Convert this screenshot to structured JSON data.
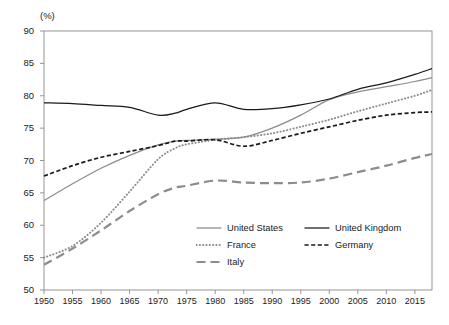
{
  "axis_unit_label": "(%)",
  "colors": {
    "gray_series": "#8c8c8c",
    "dark_series": "#1a1a1a",
    "axis": "#8a8a8a",
    "text": "#1a1a1a",
    "background": "#ffffff"
  },
  "legend": {
    "entries": [
      {
        "label": "United States",
        "style": "solid",
        "color": "#8c8c8c",
        "row": 0,
        "col": 0
      },
      {
        "label": "United Kingdom",
        "style": "solid",
        "color": "#1a1a1a",
        "row": 0,
        "col": 1
      },
      {
        "label": "France",
        "style": "dotted",
        "color": "#8c8c8c",
        "row": 1,
        "col": 0
      },
      {
        "label": "Germany",
        "style": "dashed",
        "color": "#1a1a1a",
        "row": 1,
        "col": 1
      },
      {
        "label": "Italy",
        "style": "longdash",
        "color": "#8c8c8c",
        "row": 2,
        "col": 0
      }
    ]
  },
  "chart_data": {
    "type": "line",
    "title": "",
    "subtitle": "",
    "xlabel": "",
    "ylabel": "",
    "unit": "(%)",
    "xlim": [
      1950,
      2018
    ],
    "ylim": [
      50,
      90
    ],
    "yticks": [
      50,
      55,
      60,
      65,
      70,
      75,
      80,
      85,
      90
    ],
    "xticks": [
      1950,
      1955,
      1960,
      1965,
      1970,
      1975,
      1980,
      1985,
      1990,
      1995,
      2000,
      2005,
      2010,
      2015
    ],
    "grid": false,
    "legend_position": "bottom-center",
    "series": [
      {
        "name": "United States",
        "style": "solid",
        "color": "#8c8c8c",
        "x": [
          1950,
          1955,
          1960,
          1965,
          1970,
          1973,
          1975,
          1980,
          1985,
          1990,
          1995,
          2000,
          2005,
          2010,
          2015,
          2018
        ],
        "values": [
          63.8,
          66.4,
          68.8,
          70.8,
          72.4,
          73.0,
          73.1,
          73.3,
          73.6,
          75.0,
          77.0,
          79.4,
          80.6,
          81.4,
          82.2,
          82.8
        ]
      },
      {
        "name": "United Kingdom",
        "style": "solid",
        "color": "#1a1a1a",
        "x": [
          1950,
          1955,
          1960,
          1965,
          1970,
          1973,
          1975,
          1980,
          1985,
          1990,
          1995,
          2000,
          2005,
          2010,
          2015,
          2018
        ],
        "values": [
          78.9,
          78.8,
          78.5,
          78.2,
          77.0,
          77.3,
          77.9,
          78.9,
          77.9,
          78.0,
          78.6,
          79.5,
          81.0,
          82.0,
          83.3,
          84.2
        ]
      },
      {
        "name": "France",
        "style": "dotted",
        "color": "#8c8c8c",
        "x": [
          1950,
          1955,
          1960,
          1965,
          1970,
          1973,
          1975,
          1980,
          1985,
          1990,
          1995,
          2000,
          2005,
          2010,
          2015,
          2018
        ],
        "values": [
          55.0,
          56.8,
          60.4,
          65.2,
          70.2,
          71.9,
          72.5,
          73.2,
          73.6,
          74.2,
          75.2,
          76.3,
          77.6,
          78.8,
          80.0,
          80.9
        ]
      },
      {
        "name": "Germany",
        "style": "dashed",
        "color": "#1a1a1a",
        "x": [
          1950,
          1955,
          1960,
          1965,
          1970,
          1973,
          1975,
          1980,
          1985,
          1990,
          1995,
          2000,
          2005,
          2010,
          2015,
          2018
        ],
        "values": [
          67.6,
          69.2,
          70.5,
          71.4,
          72.3,
          73.0,
          73.0,
          73.2,
          72.2,
          73.1,
          74.2,
          75.2,
          76.2,
          77.0,
          77.4,
          77.5
        ]
      },
      {
        "name": "Italy",
        "style": "longdash",
        "color": "#8c8c8c",
        "x": [
          1950,
          1955,
          1960,
          1965,
          1970,
          1973,
          1975,
          1980,
          1985,
          1990,
          1995,
          2000,
          2005,
          2010,
          2015,
          2018
        ],
        "values": [
          53.9,
          56.4,
          59.2,
          62.2,
          64.8,
          65.8,
          66.1,
          66.9,
          66.6,
          66.5,
          66.6,
          67.2,
          68.2,
          69.2,
          70.4,
          71.0
        ]
      }
    ]
  }
}
